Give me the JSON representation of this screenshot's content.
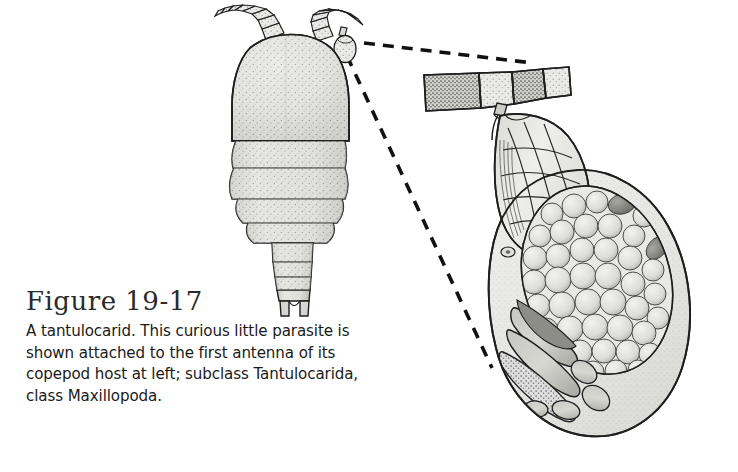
{
  "figure": {
    "title": "Figure 19-17",
    "caption_lines": [
      "A tantulocarid. This curious little parasite is",
      "shown attached to the first antenna of its",
      "copepod host at left; subclass Tantulocarida,",
      "class Maxillopoda."
    ],
    "caption_full": "A tantulocarid. This curious little parasite is shown attached to the first antenna of its copepod host at left; subclass Tantulocarida, class Maxillopoda.",
    "background_color": "#ffffff",
    "ink_color": "#1a1a1a",
    "title_color": "#2a2a2a"
  },
  "illustration": {
    "style": "stippled pen-and-ink scientific line drawing",
    "fill_light": "#e2e2e0",
    "fill_mid": "#c8c8c5",
    "fill_dark": "#9a9a96",
    "stroke": "#1e1e1e",
    "leader_line_color": "#111111",
    "parts": [
      {
        "name": "copepod-host",
        "label": "copepod host, dorsal view",
        "region": "left-upper"
      },
      {
        "name": "tantulocarid-small",
        "label": "tantulocarid attached to first antenna",
        "region": "left-upper, on host antenna"
      },
      {
        "name": "leader-line-upper",
        "label": "dashed leader from attached parasite to magnified view"
      },
      {
        "name": "leader-line-lower",
        "label": "dashed leader from attached parasite to magnified view"
      },
      {
        "name": "host-antenna-segment",
        "label": "segmented first antenna of copepod host, magnified",
        "region": "right-upper"
      },
      {
        "name": "tantulocarid-magnified",
        "label": "tantulocarid parasite, magnified",
        "region": "right"
      },
      {
        "name": "cephalic-shield",
        "label": "cephalic shield with reticulate veins"
      },
      {
        "name": "trunk-sac",
        "label": "expanded trunk sac"
      },
      {
        "name": "egg-mass",
        "label": "mass of developing eggs"
      },
      {
        "name": "larva-bodies",
        "label": "elongate larval bodies within trunk sac"
      }
    ]
  }
}
